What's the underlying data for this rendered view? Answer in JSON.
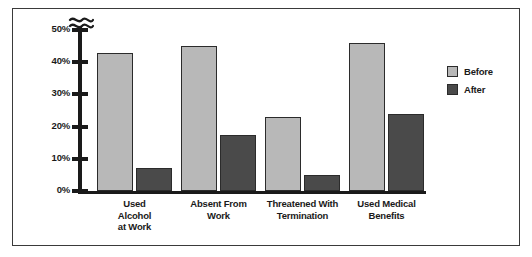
{
  "chart_data": {
    "type": "bar",
    "title": "",
    "subtitle": "",
    "xlabel": "",
    "ylabel": "",
    "categories": [
      "Used\nAlcohol\nat Work",
      "Absent From\nWork",
      "Threatened With\nTermination",
      "Used Medical\nBenefits"
    ],
    "series": [
      {
        "name": "Before",
        "values": [
          43,
          45,
          23,
          46
        ],
        "color": "#b8b8b8"
      },
      {
        "name": "After",
        "values": [
          7,
          17.5,
          5,
          24
        ],
        "color": "#4a4a4a"
      }
    ],
    "ylim": [
      0,
      50
    ],
    "yticks": [
      0,
      10,
      20,
      30,
      40,
      50
    ],
    "ytick_labels": [
      "0%",
      "10%",
      "20%",
      "30%",
      "40%",
      "50%"
    ],
    "y_axis_break": true,
    "grid": false,
    "legend_position": "right"
  },
  "legend": {
    "entries": [
      {
        "label": "Before"
      },
      {
        "label": "After"
      }
    ]
  },
  "axis": {
    "break_icon": "axis-break-squiggle"
  },
  "colors": {
    "before": "#b8b8b8",
    "after": "#4a4a4a",
    "axis": "#1a1a1a",
    "border": "#3a3a3a",
    "bar_outline": "#2b2b2b"
  }
}
